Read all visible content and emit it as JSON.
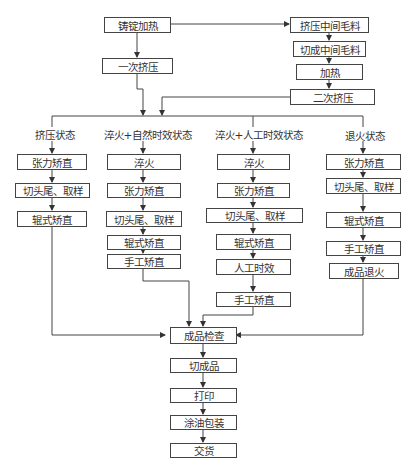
{
  "top": {
    "ingot_heating": "铸锭加热",
    "first_extrusion": "一次挤压",
    "extrude_intermediate": "挤压中间毛料",
    "cut_intermediate": "切成中间毛料",
    "heating": "加热",
    "second_extrusion": "二次挤压"
  },
  "columns": [
    {
      "label": "挤压状态",
      "steps": [
        "张力矫直",
        "切头尾、取样",
        "辊式矫直"
      ]
    },
    {
      "label": "淬火+自然时效状态",
      "steps": [
        "淬火",
        "张力矫直",
        "切头尾、取样",
        "辊式矫直",
        "手工矫直"
      ]
    },
    {
      "label": "淬火+人工时效状态",
      "steps": [
        "淬火",
        "张力矫直",
        "切头尾、取样",
        "辊式矫直",
        "人工时效",
        "手工矫直"
      ]
    },
    {
      "label": "退火状态",
      "steps": [
        "张力矫直",
        "切头尾、取样",
        "辊式矫直",
        "手工矫直",
        "成品退火"
      ]
    }
  ],
  "bottom": {
    "inspection": "成品检查",
    "cut_product": "切成品",
    "printing": "打印",
    "oiling_packing": "涂油包装",
    "delivery": "交货"
  }
}
